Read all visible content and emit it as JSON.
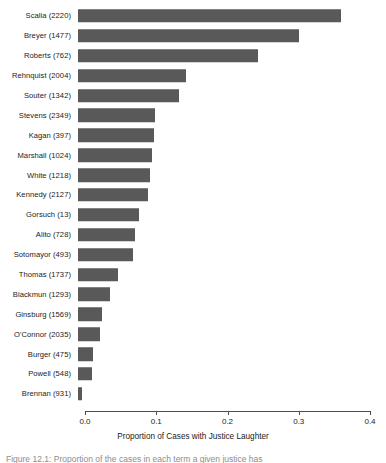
{
  "chart_data": {
    "type": "bar",
    "orientation": "horizontal",
    "title": "",
    "xlabel": "Proportion of Cases with Justice Laughter",
    "ylabel": "",
    "xlim": [
      0.0,
      0.4
    ],
    "xticks": [
      "0.0",
      "0.1",
      "0.2",
      "0.3",
      "0.4"
    ],
    "xtick_values": [
      0.0,
      0.1,
      0.2,
      0.3,
      0.4
    ],
    "grid": false,
    "legend": "none",
    "bar_color": "#595959",
    "panel_background": "#ffffff",
    "categories": [
      "Scalia (2220)",
      "Breyer (1477)",
      "Roberts (762)",
      "Rehnquist (2004)",
      "Souter (1342)",
      "Stevens (2349)",
      "Kagan (397)",
      "Marshall (1024)",
      "White (1218)",
      "Kennedy (2127)",
      "Gorsuch (13)",
      "Alito (728)",
      "Sotomayor (493)",
      "Thomas (1737)",
      "Blackmun (1293)",
      "Ginsburg (1569)",
      "O'Connor (2035)",
      "Burger (475)",
      "Powell (548)",
      "Brennan (931)"
    ],
    "values": [
      0.369,
      0.31,
      0.253,
      0.152,
      0.142,
      0.108,
      0.107,
      0.104,
      0.101,
      0.098,
      0.086,
      0.08,
      0.077,
      0.056,
      0.045,
      0.034,
      0.031,
      0.021,
      0.019,
      0.006
    ],
    "justices": [
      {
        "name": "Scalia",
        "cases": 2220,
        "proportion": 0.369
      },
      {
        "name": "Breyer",
        "cases": 1477,
        "proportion": 0.31
      },
      {
        "name": "Roberts",
        "cases": 762,
        "proportion": 0.253
      },
      {
        "name": "Rehnquist",
        "cases": 2004,
        "proportion": 0.152
      },
      {
        "name": "Souter",
        "cases": 1342,
        "proportion": 0.142
      },
      {
        "name": "Stevens",
        "cases": 2349,
        "proportion": 0.108
      },
      {
        "name": "Kagan",
        "cases": 397,
        "proportion": 0.107
      },
      {
        "name": "Marshall",
        "cases": 1024,
        "proportion": 0.104
      },
      {
        "name": "White",
        "cases": 1218,
        "proportion": 0.101
      },
      {
        "name": "Kennedy",
        "cases": 2127,
        "proportion": 0.098
      },
      {
        "name": "Gorsuch",
        "cases": 13,
        "proportion": 0.086
      },
      {
        "name": "Alito",
        "cases": 728,
        "proportion": 0.08
      },
      {
        "name": "Sotomayor",
        "cases": 493,
        "proportion": 0.077
      },
      {
        "name": "Thomas",
        "cases": 1737,
        "proportion": 0.056
      },
      {
        "name": "Blackmun",
        "cases": 1293,
        "proportion": 0.045
      },
      {
        "name": "Ginsburg",
        "cases": 1569,
        "proportion": 0.034
      },
      {
        "name": "O'Connor",
        "cases": 2035,
        "proportion": 0.031
      },
      {
        "name": "Burger",
        "cases": 475,
        "proportion": 0.021
      },
      {
        "name": "Powell",
        "cases": 548,
        "proportion": 0.019
      },
      {
        "name": "Brennan",
        "cases": 931,
        "proportion": 0.006
      }
    ]
  },
  "caption": {
    "text": "Figure 12.1:  Proportion of the cases in each term a given justice has"
  }
}
